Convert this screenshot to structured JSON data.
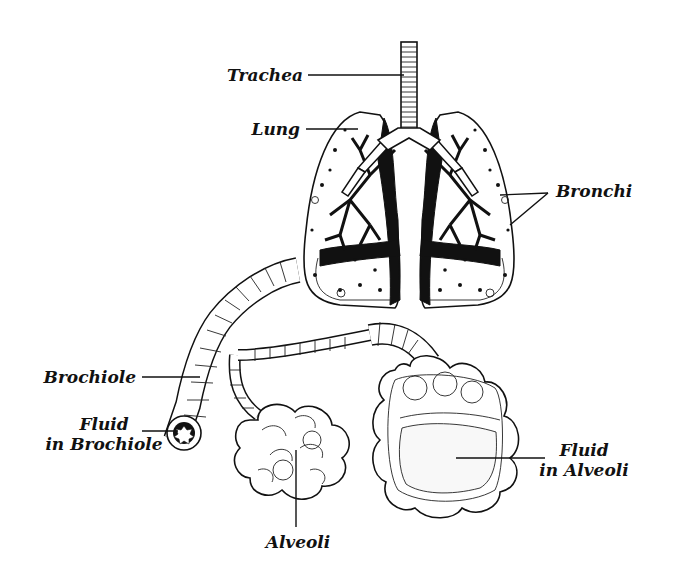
{
  "diagram": {
    "labels": {
      "trachea": "Trachea",
      "lung": "Lung",
      "bronchi": "Bronchi",
      "brochiole": "Brochiole",
      "fluid_brochiole_line1": "Fluid",
      "fluid_brochiole_line2": "in Brochiole",
      "alveoli": "Alveoli",
      "fluid_alveoli_line1": "Fluid",
      "fluid_alveoli_line2": "in Alveoli"
    },
    "colors": {
      "ink": "#111111",
      "background": "#ffffff"
    }
  }
}
